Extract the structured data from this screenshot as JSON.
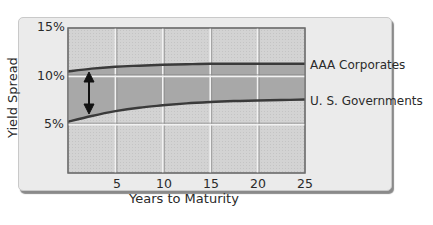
{
  "chart_data": {
    "type": "area",
    "title": "",
    "xlabel": "Years to Maturity",
    "ylabel": "Yield Spread",
    "xlim": [
      0,
      25
    ],
    "ylim": [
      0,
      15
    ],
    "x_ticks": [
      "5",
      "10",
      "15",
      "20",
      "25"
    ],
    "y_ticks": [
      "5%",
      "10%",
      "15%"
    ],
    "grid": true,
    "legend_position": "right",
    "x": [
      0,
      2.5,
      5,
      7.5,
      10,
      12.5,
      15,
      17.5,
      20,
      22.5,
      25
    ],
    "series": [
      {
        "name": "AAA Corporates",
        "values": [
          10.5,
          10.8,
          11.0,
          11.1,
          11.2,
          11.25,
          11.3,
          11.3,
          11.3,
          11.3,
          11.3
        ]
      },
      {
        "name": "U. S. Governments",
        "values": [
          5.3,
          5.9,
          6.4,
          6.75,
          7.0,
          7.2,
          7.35,
          7.45,
          7.5,
          7.55,
          7.6
        ]
      }
    ],
    "annotations": [
      {
        "type": "double-arrow",
        "x": 2,
        "from": 10.7,
        "to": 5.8,
        "meaning": "yield spread between AAA Corporates and U.S. Governments"
      }
    ]
  },
  "labels": {
    "ylabel": "Yield Spread",
    "xlabel": "Years to Maturity",
    "yticks": [
      "15%",
      "10%",
      "5%"
    ],
    "xticks": [
      "5",
      "10",
      "15",
      "20",
      "25"
    ],
    "legend_aaa": "AAA Corporates",
    "legend_govt": "U. S. Governments"
  },
  "colors": {
    "card_bg": "#ebebeb",
    "plot_bg": "#d2d2d2",
    "band_fill": "#a9a9a9",
    "curve": "#3c3c3c",
    "grid": "#f4f4f4",
    "arrow": "#111111"
  }
}
